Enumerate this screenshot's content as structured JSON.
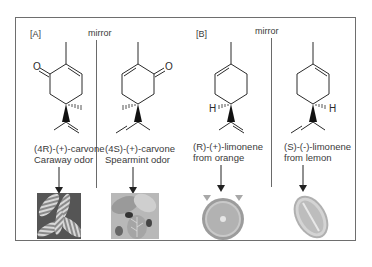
{
  "figure": {
    "panel_tags": [
      "[A]",
      "[B]"
    ],
    "mirror_label": "mirror",
    "mirrors": [
      {
        "label": "mirror"
      },
      {
        "label": "mirror"
      }
    ],
    "molecules": [
      {
        "name": "(4R)-(+)-carvone",
        "description": "Caraway odor",
        "image": "caraway-seeds-photo"
      },
      {
        "name": "(4S)-(+)-carvone",
        "description": "Spearmint odor",
        "image": "spearmint-leaves-photo"
      },
      {
        "name": "(R)-(+)-limonene",
        "description": "from orange",
        "image": "orange-half-photo"
      },
      {
        "name": "(S)-(-)-limonene",
        "description": "from lemon",
        "image": "lemon-half-photo"
      }
    ],
    "atom_labels": {
      "oxygen": "O",
      "hydrogen": "H"
    }
  },
  "colors": {
    "frame": "#6e6e6e",
    "text": "#3a3a3a",
    "bond": "#2a2a2a"
  }
}
